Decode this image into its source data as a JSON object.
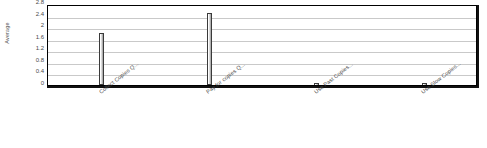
{
  "chart_data": {
    "type": "bar",
    "title": "",
    "xlabel": "",
    "ylabel": "Average",
    "categories": [
      "Collect Copies Q...",
      "Pay for copies Q...",
      "Use Past Copies...",
      "Use Slow Copies..."
    ],
    "values": [
      1.8,
      2.5,
      0.02,
      0.02
    ],
    "ylim": [
      0,
      2.8
    ],
    "ytick_labels": [
      "2.8",
      "2.4",
      "2",
      "1.6",
      "1.2",
      "0.8",
      "0.4",
      "0"
    ],
    "ytick_values": [
      2.8,
      2.4,
      2.0,
      1.6,
      1.2,
      0.8,
      0.4,
      0
    ],
    "grid": true,
    "legend": false,
    "bar_color": "#cccccc",
    "bar_edge_color": "#3a3a3a",
    "gridline_color": "#c9c9c9",
    "frame_color": "#000000",
    "background": "#ffffff"
  }
}
